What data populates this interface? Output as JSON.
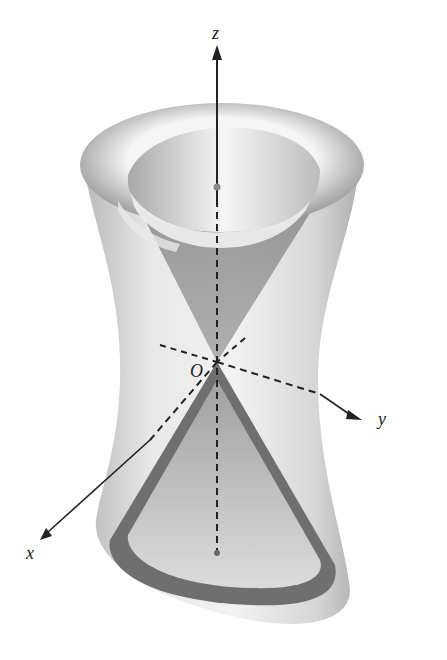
{
  "figure": {
    "axes": {
      "z_label": "z",
      "y_label": "y",
      "x_label": "x",
      "origin_label": "O"
    },
    "colors": {
      "background": "#ffffff",
      "hyperboloid_light": "#e6e6e6",
      "hyperboloid_mid": "#bdbdbd",
      "hyperboloid_dark": "#8c8c8c",
      "cone": "#9a9a9a",
      "cone_rim_dark": "#6e6e6e",
      "axis": "#222222"
    }
  }
}
